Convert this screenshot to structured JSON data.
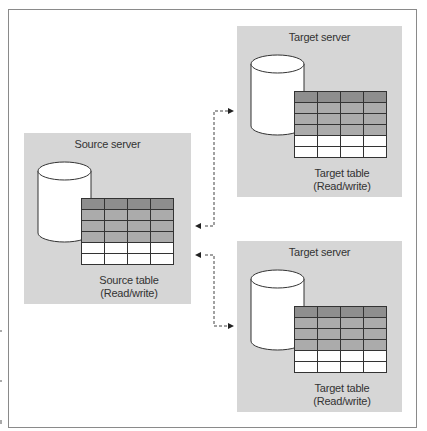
{
  "diagram": {
    "type": "replication topology",
    "source": {
      "title": "Source server",
      "table_caption_line1": "Source table",
      "table_caption_line2": "(Read/write)"
    },
    "targets": [
      {
        "title": "Target server",
        "table_caption_line1": "Target table",
        "table_caption_line2": "(Read/write)"
      },
      {
        "title": "Target server",
        "table_caption_line1": "Target table",
        "table_caption_line2": "(Read/write)"
      }
    ],
    "connections": [
      {
        "from": "Source server",
        "to": "Target server 1",
        "style": "dashed bidirectional"
      },
      {
        "from": "Source server",
        "to": "Target server 2",
        "style": "dashed bidirectional"
      }
    ],
    "table_rows": {
      "dark_header": 1,
      "gray": 3,
      "white": 2,
      "columns": 4
    },
    "colors": {
      "panel": "#d6d6d6",
      "header_row": "#8e8e8e",
      "gray_row": "#ababab",
      "white_row": "#ffffff",
      "border": "#333333"
    }
  }
}
